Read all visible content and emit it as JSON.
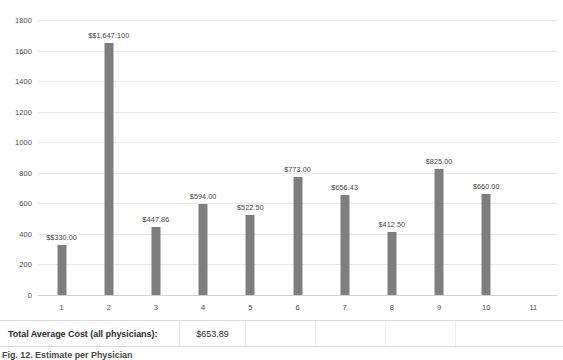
{
  "chart_data": {
    "type": "bar",
    "title": "",
    "subtitle": "",
    "xlabel": "",
    "ylabel": "",
    "categories": [
      "1",
      "2",
      "3",
      "4",
      "5",
      "6",
      "7",
      "8",
      "9",
      "10",
      "11"
    ],
    "values": [
      330.0,
      1647.1,
      447.86,
      594.0,
      522.5,
      773.0,
      656.43,
      412.5,
      825.0,
      660.0,
      null
    ],
    "data_labels": [
      "$$330.00",
      "$$1,647.100",
      "$447.86",
      "$594.00",
      "$522.50",
      "$773.00",
      "$656.43",
      "$412.50",
      "$825.00",
      "$660.00",
      ""
    ],
    "ylim": [
      0,
      1800
    ],
    "yticks": [
      0,
      200,
      400,
      600,
      800,
      1000,
      1200,
      1400,
      1600,
      1800
    ],
    "ytick_labels": [
      "0",
      "200",
      "400",
      "600",
      "800",
      "1000",
      "1200",
      "1400",
      "1600",
      "1800"
    ],
    "grid": true,
    "grid_axis": "y",
    "legend": false,
    "legend_position": "none",
    "bar_color": "#7e7e7e",
    "gridline_color": "#e8e8e8",
    "plot_background": "#ffffff"
  },
  "summary": {
    "label": "Total Average Cost (all physicians):",
    "value": "$653.89"
  },
  "caption": {
    "text": "Fig. 12. Estimate per Physician"
  }
}
